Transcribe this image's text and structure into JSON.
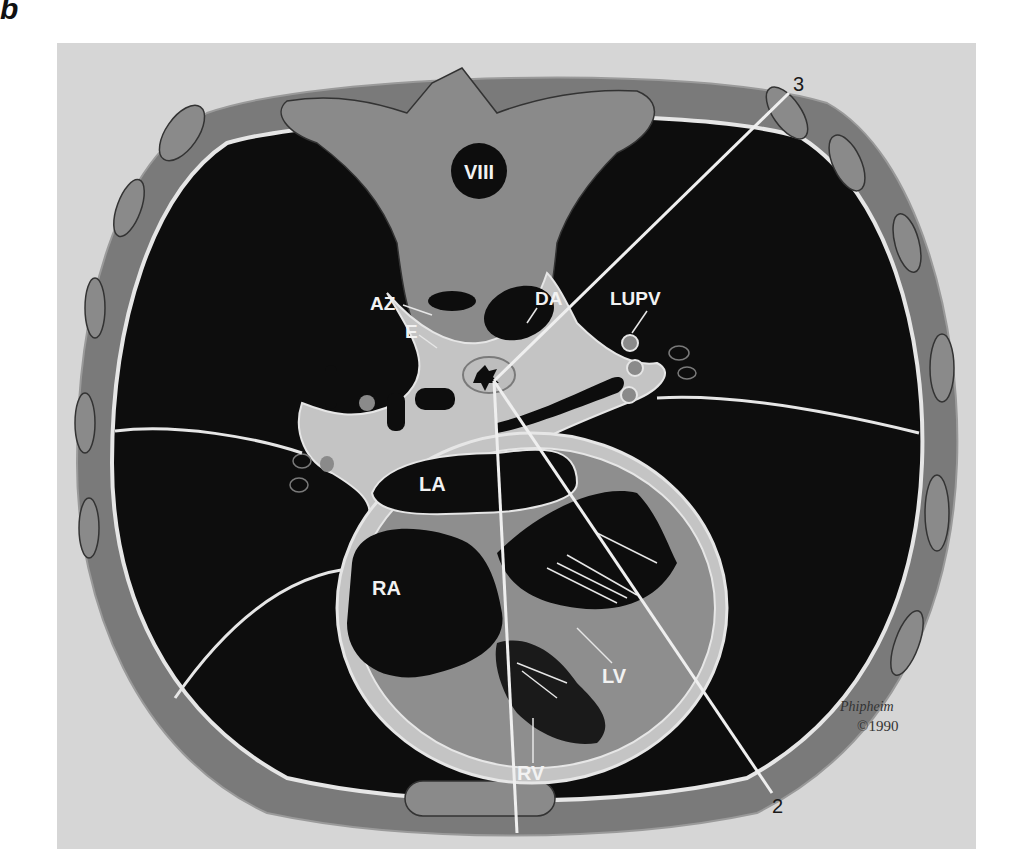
{
  "figure": {
    "panel_letter": "b",
    "colors": {
      "background": "#d6d6d6",
      "lung": "#0d0d0d",
      "soft_tissue": "#7a7a7a",
      "outline": "#e6e6e6",
      "mediastinum": "#c4c4c4",
      "myocardium": "#8e8e8e",
      "label": "#f2f2f2",
      "line_number": "#1a1a1a"
    }
  },
  "labels": {
    "vertebra": "VIII",
    "azygos": "AZ",
    "esophagus": "E",
    "descending_aorta": "DA",
    "left_upper_pulmonary_vein": "LUPV",
    "left_atrium": "LA",
    "right_atrium": "RA",
    "left_ventricle": "LV",
    "right_ventricle": "RV"
  },
  "scan_lines": [
    {
      "id": "1",
      "label": "1"
    },
    {
      "id": "2",
      "label": "2"
    },
    {
      "id": "3",
      "label": "3"
    }
  ],
  "signature": {
    "artist": "Phipheim",
    "copyright": "©1990"
  }
}
